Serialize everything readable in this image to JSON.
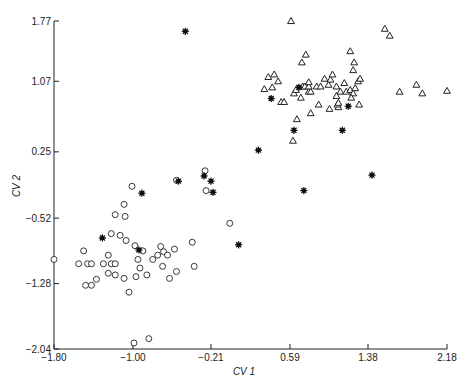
{
  "chart_data": {
    "type": "scatter",
    "title": "",
    "xlabel": "CV 1",
    "ylabel": "CV 2",
    "xlim": [
      -1.8,
      2.18
    ],
    "ylim": [
      -2.04,
      1.77
    ],
    "x_ticks": [
      "-1.80",
      "-1.00",
      "-0.21",
      "0.59",
      "1.38",
      "2.18"
    ],
    "y_ticks": [
      "1.77",
      "1.07",
      "0.25",
      "-0.52",
      "-1.28",
      "-2.04"
    ],
    "grid": false,
    "legend": null,
    "series": [
      {
        "name": "open-circles",
        "marker": "circle-open",
        "points": [
          [
            -1.8,
            -1.0
          ],
          [
            -1.55,
            -1.05
          ],
          [
            -1.5,
            -0.9
          ],
          [
            -1.46,
            -1.05
          ],
          [
            -1.42,
            -1.05
          ],
          [
            -1.48,
            -1.3
          ],
          [
            -1.42,
            -1.3
          ],
          [
            -1.37,
            -1.23
          ],
          [
            -1.3,
            -1.05
          ],
          [
            -1.25,
            -0.95
          ],
          [
            -1.22,
            -1.05
          ],
          [
            -1.18,
            -1.05
          ],
          [
            -1.25,
            -1.16
          ],
          [
            -1.18,
            -1.18
          ],
          [
            -1.22,
            -0.7
          ],
          [
            -1.18,
            -0.48
          ],
          [
            -1.08,
            -0.5
          ],
          [
            -1.13,
            -0.72
          ],
          [
            -1.07,
            -0.78
          ],
          [
            -1.09,
            -0.36
          ],
          [
            -1.01,
            -0.15
          ],
          [
            -0.98,
            -0.84
          ],
          [
            -0.9,
            -0.9
          ],
          [
            -0.95,
            -1.0
          ],
          [
            -0.93,
            -1.1
          ],
          [
            -0.86,
            -1.18
          ],
          [
            -1.09,
            -1.22
          ],
          [
            -1.04,
            -1.38
          ],
          [
            -0.99,
            -1.97
          ],
          [
            -0.84,
            -1.92
          ],
          [
            -0.97,
            -1.2
          ],
          [
            -0.8,
            -1.0
          ],
          [
            -0.75,
            -0.95
          ],
          [
            -0.72,
            -0.85
          ],
          [
            -0.7,
            -1.08
          ],
          [
            -0.69,
            -0.91
          ],
          [
            -0.65,
            -0.95
          ],
          [
            -0.58,
            -0.88
          ],
          [
            -0.56,
            -0.08
          ],
          [
            -0.63,
            -1.22
          ],
          [
            -0.56,
            -1.14
          ],
          [
            -0.4,
            -0.8
          ],
          [
            -0.27,
            0.03
          ],
          [
            -0.38,
            -1.08
          ],
          [
            -0.26,
            -0.2
          ],
          [
            -0.02,
            -0.58
          ]
        ]
      },
      {
        "name": "open-triangles",
        "marker": "triangle-open",
        "points": [
          [
            0.6,
            1.77
          ],
          [
            0.43,
            1.15
          ],
          [
            0.37,
            1.12
          ],
          [
            0.47,
            1.07
          ],
          [
            0.41,
            1.0
          ],
          [
            0.33,
            0.98
          ],
          [
            0.5,
            0.83
          ],
          [
            0.53,
            0.83
          ],
          [
            0.63,
            0.93
          ],
          [
            0.65,
            0.97
          ],
          [
            0.7,
            0.88
          ],
          [
            0.72,
            1.01
          ],
          [
            0.74,
            1.01
          ],
          [
            0.78,
            0.95
          ],
          [
            0.8,
            0.95
          ],
          [
            0.78,
            1.01
          ],
          [
            0.78,
            1.06
          ],
          [
            0.86,
            1.01
          ],
          [
            0.9,
            1.01
          ],
          [
            0.98,
            1.03
          ],
          [
            0.94,
            1.1
          ],
          [
            1.0,
            1.09
          ],
          [
            1.06,
            1.01
          ],
          [
            1.1,
            0.95
          ],
          [
            1.14,
            1.05
          ],
          [
            1.02,
            1.15
          ],
          [
            1.06,
            0.9
          ],
          [
            1.16,
            0.95
          ],
          [
            1.2,
            0.97
          ],
          [
            1.23,
            0.93
          ],
          [
            1.25,
            0.99
          ],
          [
            1.28,
            1.07
          ],
          [
            1.3,
            1.1
          ],
          [
            1.24,
            1.29
          ],
          [
            1.23,
            1.2
          ],
          [
            1.2,
            1.42
          ],
          [
            0.71,
            1.29
          ],
          [
            0.75,
            1.38
          ],
          [
            1.08,
            0.77
          ],
          [
            1.07,
            0.8
          ],
          [
            0.99,
            0.75
          ],
          [
            0.88,
            0.8
          ],
          [
            0.8,
            0.7
          ],
          [
            0.66,
            0.63
          ],
          [
            0.62,
            0.38
          ],
          [
            1.29,
            0.8
          ],
          [
            1.08,
            0.82
          ],
          [
            1.55,
            1.68
          ],
          [
            1.6,
            1.6
          ],
          [
            1.7,
            0.95
          ],
          [
            1.87,
            1.03
          ],
          [
            1.93,
            0.93
          ],
          [
            2.18,
            0.96
          ],
          [
            1.21,
            0.88
          ]
        ]
      },
      {
        "name": "filled-stars",
        "marker": "asterisk-filled",
        "points": [
          [
            -0.47,
            1.65
          ],
          [
            -1.31,
            -0.75
          ],
          [
            -0.91,
            -0.23
          ],
          [
            -0.94,
            -0.89
          ],
          [
            -0.54,
            -0.09
          ],
          [
            -0.28,
            -0.03
          ],
          [
            -0.21,
            -0.09
          ],
          [
            -0.19,
            -0.22
          ],
          [
            0.07,
            -0.83
          ],
          [
            0.27,
            0.27
          ],
          [
            0.4,
            0.87
          ],
          [
            0.73,
            -0.2
          ],
          [
            0.63,
            0.5
          ],
          [
            0.68,
            1.0
          ],
          [
            1.12,
            0.5
          ],
          [
            1.18,
            0.78
          ],
          [
            1.42,
            -0.02
          ]
        ]
      }
    ]
  }
}
